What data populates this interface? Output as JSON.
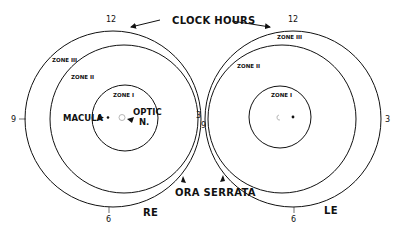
{
  "header": {
    "clock_hours_label": "CLOCK HOURS"
  },
  "colors": {
    "stroke": "#111111",
    "background": "#ffffff"
  },
  "right_eye": {
    "eye_label": "RE",
    "clock": {
      "12": "12",
      "3": "3",
      "6": "6",
      "9": "9"
    },
    "zones": {
      "zone1": "ZONE I",
      "zone2": "ZONE II",
      "zone3": "ZONE III"
    },
    "macula_label": "MACULA",
    "optic_label_line1": "OPTIC",
    "optic_label_line2": "N."
  },
  "left_eye": {
    "eye_label": "LE",
    "clock": {
      "12": "12",
      "3": "3",
      "6": "6",
      "9": "9"
    },
    "zones": {
      "zone1": "ZONE I",
      "zone2": "ZONE II",
      "zone3": "ZONE III"
    }
  },
  "ora_serrata_label": "ORA SERRATA"
}
